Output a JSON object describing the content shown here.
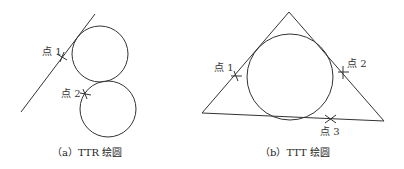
{
  "figures": [
    {
      "id": "a",
      "caption": "（a）TTR 绘圆",
      "points": [
        {
          "label": "点 1"
        },
        {
          "label": "点 2"
        }
      ]
    },
    {
      "id": "b",
      "caption": "（b）TTT 绘圆",
      "points": [
        {
          "label": "点 1"
        },
        {
          "label": "点 2"
        },
        {
          "label": "点 3"
        }
      ]
    }
  ],
  "colors": {
    "stroke": "#333333",
    "background": "#ffffff"
  }
}
